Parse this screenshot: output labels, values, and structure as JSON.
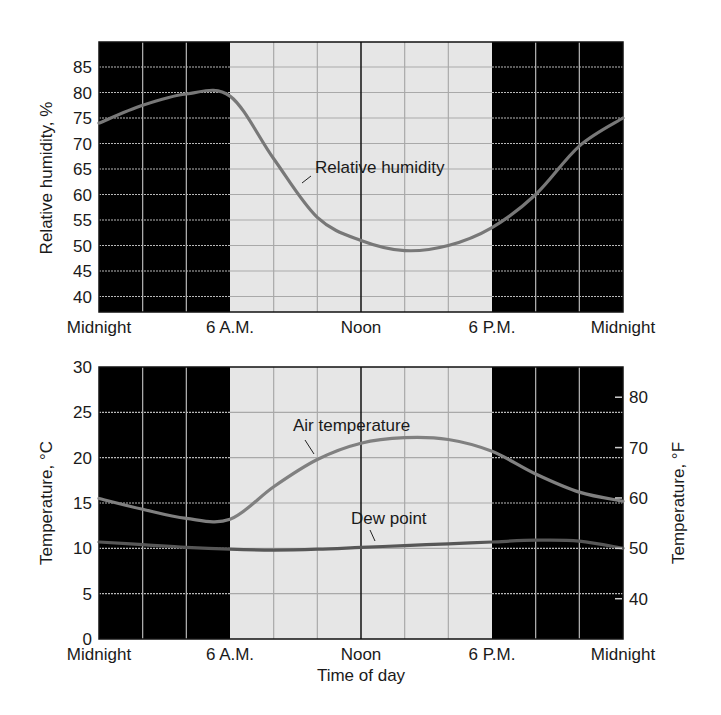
{
  "chart_data": [
    {
      "type": "line",
      "title": "",
      "xlabel": "",
      "ylabel": "Relative humidity, %",
      "x_hours": [
        0,
        2,
        4,
        6,
        8,
        10,
        12,
        14,
        16,
        18,
        20,
        22,
        24
      ],
      "x_tick_labels": [
        {
          "hour": 0,
          "label": "Midnight"
        },
        {
          "hour": 6,
          "label": "6 A.M."
        },
        {
          "hour": 12,
          "label": "Noon"
        },
        {
          "hour": 18,
          "label": "6 P.M."
        },
        {
          "hour": 24,
          "label": "Midnight"
        }
      ],
      "y_ticks": [
        40,
        45,
        50,
        55,
        60,
        65,
        70,
        75,
        80,
        85
      ],
      "ylim": [
        37,
        90
      ],
      "night_shading": [
        [
          0,
          6
        ],
        [
          18,
          24
        ]
      ],
      "grid": true,
      "series": [
        {
          "name": "Relative humidity",
          "values": [
            74,
            77.5,
            79.7,
            79.3,
            67,
            55.5,
            51,
            49,
            50,
            53.5,
            60,
            69.5,
            75
          ]
        }
      ],
      "annotations": [
        {
          "text": "Relative humidity",
          "hour": 9.6,
          "value": 65
        }
      ]
    },
    {
      "type": "line",
      "title": "",
      "xlabel": "Time of day",
      "ylabel": "Temperature, °C",
      "ylabel_right": "Temperature, °F",
      "x_hours": [
        0,
        2,
        4,
        6,
        8,
        10,
        12,
        14,
        16,
        18,
        20,
        22,
        24
      ],
      "x_tick_labels": [
        {
          "hour": 0,
          "label": "Midnight"
        },
        {
          "hour": 6,
          "label": "6 A.M."
        },
        {
          "hour": 12,
          "label": "Noon"
        },
        {
          "hour": 18,
          "label": "6 P.M."
        },
        {
          "hour": 24,
          "label": "Midnight"
        }
      ],
      "y_ticks": [
        0,
        5,
        10,
        15,
        20,
        25,
        30
      ],
      "ylim": [
        0,
        30
      ],
      "y_right_ticks": [
        40,
        50,
        60,
        70,
        80
      ],
      "night_shading": [
        [
          0,
          6
        ],
        [
          18,
          24
        ]
      ],
      "grid": true,
      "series": [
        {
          "name": "Air temperature",
          "values": [
            15.5,
            14.3,
            13.3,
            13.2,
            16.8,
            19.8,
            21.6,
            22.2,
            22.0,
            20.7,
            18.2,
            16.2,
            15.2
          ]
        },
        {
          "name": "Dew point",
          "values": [
            10.7,
            10.4,
            10.1,
            9.9,
            9.8,
            9.9,
            10.1,
            10.3,
            10.5,
            10.7,
            10.9,
            10.8,
            10.0
          ]
        }
      ],
      "annotations": [
        {
          "text": "Air temperature",
          "hour": 8.6,
          "value": 22.5
        },
        {
          "text": "Dew point",
          "hour": 12.7,
          "value": 12.2
        }
      ]
    }
  ],
  "labels": {
    "top_ylabel": "Relative humidity, %",
    "bottom_ylabel": "Temperature, °C",
    "bottom_ylabel_right": "Temperature, °F",
    "xlabel": "Time of day",
    "rh_annotation": "Relative humidity",
    "air_annotation": "Air temperature",
    "dew_annotation": "Dew point"
  },
  "colors": {
    "night": "#000000",
    "day": "#e6e6e6",
    "grid_day": "#a9a9a9",
    "grid_night": "#b8b8b8",
    "noon_line": "#1f1f1f",
    "rh_curve": "#787878",
    "air_curve": "#808080",
    "dew_curve": "#575757",
    "text": "#1a1a1a"
  }
}
